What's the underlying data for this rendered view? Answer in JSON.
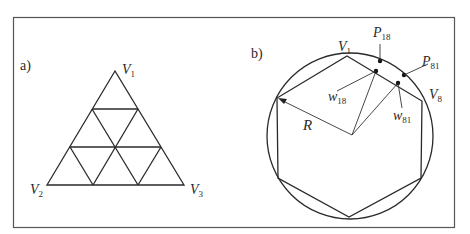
{
  "panel_a": {
    "label": "a)",
    "vertices": {
      "v1": {
        "main": "V",
        "sub": "1"
      },
      "v2": {
        "main": "V",
        "sub": "2"
      },
      "v3": {
        "main": "V",
        "sub": "3"
      }
    },
    "description": "Equilateral triangle subdivided into 9 smaller triangles (3 levels)"
  },
  "panel_b": {
    "label": "b)",
    "vertices": {
      "v1": {
        "main": "V",
        "sub": "1"
      },
      "v8": {
        "main": "V",
        "sub": "8"
      }
    },
    "points": {
      "p18": {
        "main": "P",
        "sub": "18"
      },
      "p81": {
        "main": "P",
        "sub": "81"
      },
      "w18": {
        "main": "w",
        "sub": "18"
      },
      "w81": {
        "main": "w",
        "sub": "81"
      }
    },
    "radius_label": "R",
    "description": "Regular hexagon inscribed in a circle of radius R"
  },
  "colors": {
    "stroke": "#2a2a2a",
    "background": "#ffffff"
  }
}
